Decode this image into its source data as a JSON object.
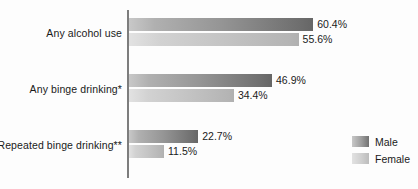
{
  "chart_data": {
    "type": "bar",
    "orientation": "horizontal",
    "title": "",
    "subtitle": "",
    "xlabel": "",
    "ylabel": "",
    "grid": false,
    "legend_position": "right-bottom",
    "value_suffix": "%",
    "xlim": [
      0,
      62
    ],
    "categories": [
      "Any alcohol use",
      "Any binge drinking*",
      "Repeated binge drinking**"
    ],
    "series": [
      {
        "name": "Male",
        "color": "#8a8a8a",
        "values": [
          60.4,
          46.9,
          22.7
        ],
        "labels": [
          "60.4%",
          "46.9%",
          "22.7%"
        ]
      },
      {
        "name": "Female",
        "color": "#c6c6c6",
        "values": [
          55.6,
          34.4,
          11.5
        ],
        "labels": [
          "55.6%",
          "34.4%",
          "11.5%"
        ]
      }
    ],
    "annotations": []
  },
  "legend": {
    "items": [
      {
        "label": "Male"
      },
      {
        "label": "Female"
      }
    ]
  },
  "colors": {
    "background": "#fdfdfd",
    "axis": "#7d7d7d",
    "text": "#1a1a1a",
    "male_bar_dark": "#666666",
    "male_bar_light": "#c8c8c8",
    "female_bar_dark": "#b0b0b0",
    "female_bar_light": "#e2e2e2"
  }
}
